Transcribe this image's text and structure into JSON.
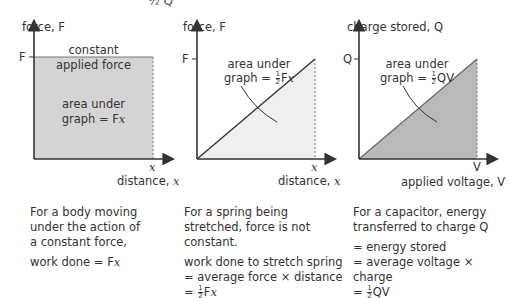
{
  "top_fragment": "½ Q",
  "panels": [
    {
      "y_axis_label": "force, F",
      "y_tick": "F",
      "x_tick": "x",
      "x_axis_label_text": "distance, ",
      "x_axis_label_var": "x",
      "top_label_line1": "constant",
      "top_label_line2": "applied force",
      "area_line1": "area under",
      "area_line2_pre": "graph = F",
      "area_line2_var": "x",
      "caption_lines": [
        "For a body moving",
        "under the action of",
        "a constant force,"
      ],
      "result_pre": "work done = F",
      "result_var": "x",
      "fill_color": "#d4d4d4"
    },
    {
      "y_axis_label": "force, F",
      "y_tick": "F",
      "x_tick": "x",
      "x_axis_label_text": "distance, ",
      "x_axis_label_var": "x",
      "area_line1": "area under",
      "area_line2_pre": "graph = ",
      "area_frac_num": "1",
      "area_frac_den": "2",
      "area_line2_post": "F",
      "area_line2_var": "x",
      "caption_lines": [
        "For a spring being",
        "stretched, force is not",
        "constant."
      ],
      "result_line1": "work done to stretch spring",
      "result_line2": "= average force × distance",
      "result_line3_pre": "= ",
      "result_frac_num": "1",
      "result_frac_den": "2",
      "result_line3_post": "F",
      "result_line3_var": "x",
      "fill_color": "#efefef"
    },
    {
      "y_axis_label": "charge stored, Q",
      "y_tick": "Q",
      "x_tick": "V",
      "x_axis_label_text": "applied voltage, V",
      "area_line1": "area under",
      "area_line2_pre": "graph = ",
      "area_frac_num": "1",
      "area_frac_den": "2",
      "area_line2_post": "QV",
      "caption_lines": [
        "For a capacitor, energy",
        "transferred to charge Q"
      ],
      "result_line1": "= energy stored",
      "result_line2": "= average voltage × charge",
      "result_line3_pre": "= ",
      "result_frac_num": "1",
      "result_frac_den": "2",
      "result_line3_post": "QV",
      "fill_color": "#b9b9b9"
    }
  ]
}
